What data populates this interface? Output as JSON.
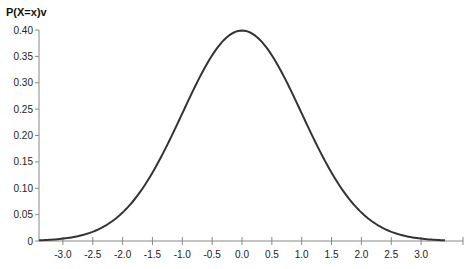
{
  "chart_data": {
    "type": "line",
    "title": "",
    "xlabel": "",
    "ylabel": "P(X=x)v",
    "xlim": [
      -3.4,
      3.4
    ],
    "ylim": [
      0,
      0.4
    ],
    "grid": false,
    "legend": null,
    "x_ticks": [
      "-3.0",
      "-2.5",
      "-2.0",
      "-1.5",
      "-1.0",
      "-0.5",
      "0.0",
      "0.5",
      "1.0",
      "1.5",
      "2.0",
      "2.5",
      "3.0"
    ],
    "x_tick_values": [
      -3.0,
      -2.5,
      -2.0,
      -1.5,
      -1.0,
      -0.5,
      0.0,
      0.5,
      1.0,
      1.5,
      2.0,
      2.5,
      3.0
    ],
    "y_ticks": [
      "0",
      "0.05",
      "0.10",
      "0.15",
      "0.20",
      "0.25",
      "0.30",
      "0.35",
      "0.40"
    ],
    "y_tick_values": [
      0,
      0.05,
      0.1,
      0.15,
      0.2,
      0.25,
      0.3,
      0.35,
      0.4
    ],
    "series": [
      {
        "name": "Standard normal PDF",
        "color": "#333333",
        "x": [
          -3.4,
          -3.0,
          -2.5,
          -2.0,
          -1.5,
          -1.0,
          -0.5,
          0.0,
          0.5,
          1.0,
          1.5,
          2.0,
          2.5,
          3.0,
          3.4
        ],
        "y": [
          0.0012,
          0.0044,
          0.0175,
          0.054,
          0.1295,
          0.242,
          0.3521,
          0.3989,
          0.3521,
          0.242,
          0.1295,
          0.054,
          0.0175,
          0.0044,
          0.0012
        ]
      }
    ]
  },
  "colors": {
    "line": "#333333",
    "axis": "#888888",
    "text": "#222222"
  }
}
